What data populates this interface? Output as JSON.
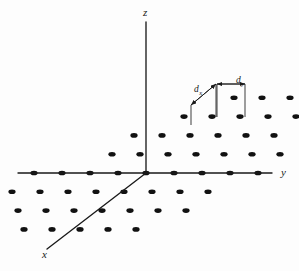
{
  "figure": {
    "kind": "3d-axes-lattice-diagram",
    "background_color": "#fdfdfd",
    "ink_color": "#1a1a1a",
    "axes": [
      {
        "id": "x",
        "label": "x",
        "label_x": 42,
        "label_y": 258,
        "x1": 146,
        "y1": 173,
        "x2": 47,
        "y2": 249
      },
      {
        "id": "y",
        "label": "y",
        "label_x": 281,
        "label_y": 176,
        "x1": 18,
        "y1": 173,
        "x2": 272,
        "y2": 173
      },
      {
        "id": "z",
        "label": "z",
        "label_x": 143,
        "label_y": 16,
        "x1": 146,
        "y1": 173,
        "x2": 146,
        "y2": 22
      }
    ],
    "origin": {
      "x": 146,
      "y": 173
    },
    "lattice": {
      "vector_y": {
        "dx": 28.0,
        "dy": 0.0
      },
      "vector_x": {
        "dx": -22.0,
        "dy": 18.8
      },
      "dot_radius_x": 3.6,
      "dot_radius_y": 2.3,
      "dot_color": "#111111",
      "i_range": [
        -3,
        4
      ],
      "j_range": [
        -4,
        4
      ],
      "points": [
        [
          0,
          0
        ],
        [
          1,
          0
        ],
        [
          2,
          0
        ],
        [
          3,
          0
        ],
        [
          4,
          0
        ],
        [
          -1,
          0
        ],
        [
          -2,
          0
        ],
        [
          -3,
          0
        ],
        [
          -4,
          0
        ],
        [
          0,
          1
        ],
        [
          1,
          1
        ],
        [
          2,
          1
        ],
        [
          3,
          1
        ],
        [
          -1,
          1
        ],
        [
          -2,
          1
        ],
        [
          -3,
          1
        ],
        [
          -4,
          1
        ],
        [
          0,
          2
        ],
        [
          1,
          2
        ],
        [
          2,
          2
        ],
        [
          3,
          2
        ],
        [
          -1,
          2
        ],
        [
          -2,
          2
        ],
        [
          -3,
          2
        ],
        [
          0,
          3
        ],
        [
          1,
          3
        ],
        [
          2,
          3
        ],
        [
          -1,
          3
        ],
        [
          -2,
          3
        ],
        [
          -3,
          3
        ],
        [
          0,
          -1
        ],
        [
          1,
          -1
        ],
        [
          2,
          -1
        ],
        [
          3,
          -1
        ],
        [
          4,
          -1
        ],
        [
          -1,
          -1
        ],
        [
          -2,
          -1
        ],
        [
          0,
          -2
        ],
        [
          1,
          -2
        ],
        [
          2,
          -2
        ],
        [
          3,
          -2
        ],
        [
          -1,
          -2
        ],
        [
          -2,
          -2
        ],
        [
          0,
          -3
        ],
        [
          1,
          -3
        ],
        [
          2,
          -3
        ],
        [
          3,
          -3
        ],
        [
          -1,
          -3
        ],
        [
          0,
          -4
        ],
        [
          1,
          -4
        ],
        [
          2,
          -4
        ]
      ]
    },
    "annotations": {
      "dx": {
        "symbol": "d",
        "subscript": "x",
        "label_x": 194,
        "label_y": 92,
        "arrow_from": {
          "x": 216,
          "y": 84
        },
        "arrow_to": {
          "x": 191,
          "y": 105
        },
        "leader_a": {
          "x1": 216,
          "y1": 84,
          "x2": 216,
          "y2": 117
        },
        "leader_b": {
          "x1": 191,
          "y1": 105,
          "x2": 191,
          "y2": 125
        }
      },
      "dy": {
        "symbol": "d",
        "subscript": "y",
        "label_x": 236,
        "label_y": 83,
        "arrow_from": {
          "x": 217,
          "y": 84
        },
        "arrow_to": {
          "x": 245,
          "y": 84
        },
        "leader_a": {
          "x1": 217,
          "y1": 84,
          "x2": 217,
          "y2": 117
        },
        "leader_b": {
          "x1": 245,
          "y1": 84,
          "x2": 245,
          "y2": 117
        }
      }
    }
  }
}
